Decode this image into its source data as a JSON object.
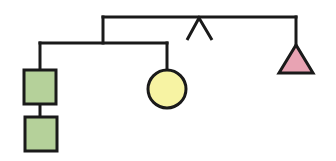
{
  "diagram": {
    "type": "tree",
    "colors": {
      "stroke": "#1a1a1a",
      "square_fill": "#b5d19a",
      "circle_fill": "#f7f3a3",
      "triangle_fill": "#e8a3b3",
      "background": "#ffffff"
    },
    "nodes": [
      {
        "id": "square-top",
        "shape": "square"
      },
      {
        "id": "square-bottom",
        "shape": "square"
      },
      {
        "id": "circle",
        "shape": "circle"
      },
      {
        "id": "caret",
        "shape": "inverted-v"
      },
      {
        "id": "triangle",
        "shape": "triangle"
      }
    ]
  }
}
